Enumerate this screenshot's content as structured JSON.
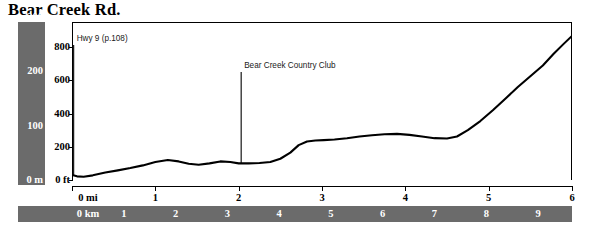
{
  "chart_data": {
    "type": "line",
    "title": "Bear Creek Rd.",
    "subtitle": "",
    "xlabel": "",
    "ylabel": "",
    "grid": false,
    "legend": "none",
    "x_axes": [
      {
        "name": "miles",
        "unit": "mi",
        "position": "bottom",
        "ticks": [
          0,
          1,
          2,
          3,
          4,
          5,
          6
        ],
        "tick_labels": [
          "0 mi",
          "1",
          "2",
          "3",
          "4",
          "5",
          "6"
        ],
        "xlim": [
          0,
          6
        ]
      },
      {
        "name": "kilometers",
        "unit": "km",
        "position": "bottom-bar",
        "ticks": [
          0,
          1,
          2,
          3,
          4,
          5,
          6,
          7,
          8,
          9
        ],
        "tick_labels": [
          "0 km",
          "1",
          "2",
          "3",
          "4",
          "5",
          "6",
          "7",
          "8",
          "9"
        ],
        "xlim": [
          0,
          9.656
        ]
      }
    ],
    "y_axes": [
      {
        "name": "feet",
        "unit": "ft",
        "position": "inner-left",
        "ticks": [
          0,
          200,
          400,
          600,
          800
        ],
        "tick_labels": [
          "0 ft",
          "200",
          "400",
          "600",
          "800"
        ],
        "ylim": [
          0,
          940
        ]
      },
      {
        "name": "meters",
        "unit": "m",
        "position": "outer-left-bar",
        "ticks": [
          0,
          100,
          200,
          300
        ],
        "tick_labels": [
          "0 m",
          "100",
          "200",
          "300"
        ],
        "ylim": [
          0,
          286
        ]
      }
    ],
    "series": [
      {
        "name": "Bear Creek Rd. elevation profile",
        "x_unit": "mi",
        "y_unit": "ft",
        "x": [
          0.0,
          0.06,
          0.14,
          0.25,
          0.4,
          0.55,
          0.7,
          0.85,
          1.0,
          1.15,
          1.28,
          1.4,
          1.52,
          1.65,
          1.78,
          1.9,
          2.0,
          2.12,
          2.25,
          2.38,
          2.5,
          2.62,
          2.72,
          2.82,
          2.92,
          3.02,
          3.15,
          3.3,
          3.45,
          3.6,
          3.75,
          3.9,
          4.05,
          4.2,
          4.35,
          4.5,
          4.62,
          4.75,
          4.9,
          5.05,
          5.2,
          5.35,
          5.5,
          5.65,
          5.78,
          5.9,
          6.0
        ],
        "y": [
          30,
          22,
          20,
          28,
          45,
          58,
          72,
          88,
          108,
          120,
          112,
          98,
          92,
          100,
          112,
          108,
          100,
          100,
          102,
          108,
          128,
          165,
          210,
          232,
          238,
          240,
          244,
          252,
          262,
          270,
          276,
          278,
          272,
          262,
          252,
          250,
          262,
          300,
          355,
          420,
          490,
          560,
          625,
          690,
          760,
          820,
          868
        ]
      }
    ],
    "annotations": [
      {
        "id": "hwy-9",
        "label": "Hwy 9 (p.108)",
        "x_mi": 0.02,
        "marker": "vertical-line",
        "label_position": "right"
      },
      {
        "id": "bear-creek-country-club",
        "label": "Bear Creek Country Club",
        "x_mi": 2.03,
        "marker": "vertical-line",
        "label_position": "right"
      }
    ],
    "colors": {
      "profile_line": "#000000",
      "axis": "#000000",
      "scale_bar": "#6b6b6b",
      "scale_bar_text": "#ffffff",
      "background": "#ffffff",
      "annotation_text": "#1a1a1a"
    }
  }
}
